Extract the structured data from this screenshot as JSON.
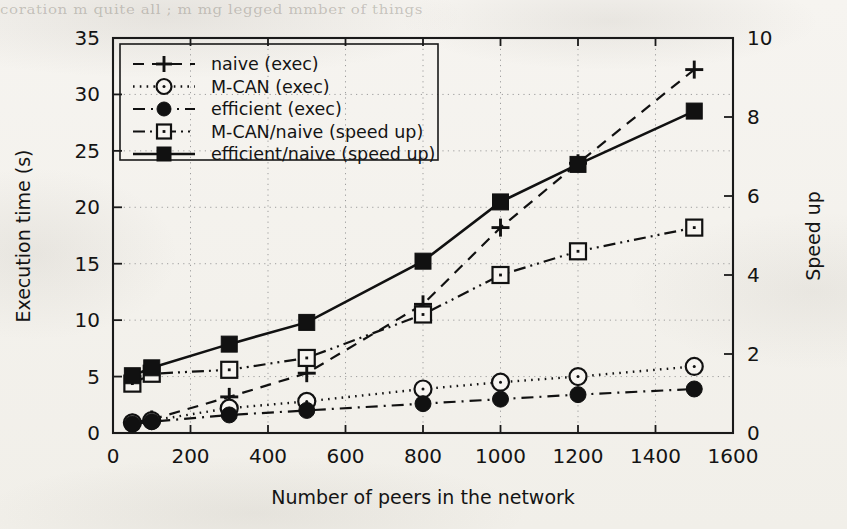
{
  "page": {
    "bleed_through_text": "coration  m  quite  all ; m  mg  legged  mmber  of  things",
    "background_color": "#f4f2ee"
  },
  "chart_data": {
    "type": "line",
    "title": "",
    "xlabel": "Number of peers in the network",
    "ylabel": "Execution time (s)",
    "y2label": "Speed up",
    "xlim": [
      0,
      1600
    ],
    "ylim": [
      0,
      35
    ],
    "y2lim": [
      0,
      10
    ],
    "xticks": [
      0,
      200,
      400,
      600,
      800,
      1000,
      1200,
      1400,
      1600
    ],
    "yticks": [
      0,
      5,
      10,
      15,
      20,
      25,
      30,
      35
    ],
    "y2ticks": [
      0,
      2,
      4,
      6,
      8,
      10
    ],
    "xtick_labels": [
      "0",
      "200",
      "400",
      "600",
      "800",
      "1000",
      "1200",
      "1400",
      "1600"
    ],
    "ytick_labels": [
      "0",
      "5",
      "10",
      "15",
      "20",
      "25",
      "30",
      "35"
    ],
    "y2tick_labels": [
      "0",
      "2",
      "4",
      "6",
      "8",
      "10"
    ],
    "grid": true,
    "legend_position": "upper left",
    "x": [
      50,
      100,
      300,
      500,
      800,
      1000,
      1200,
      1500
    ],
    "series": [
      {
        "name": "naive (exec)",
        "axis": "left",
        "marker": "plus",
        "linestyle": "dashed",
        "color": "#111111",
        "values": [
          0.9,
          1.2,
          3.2,
          5.3,
          11.4,
          18.2,
          23.9,
          32.2
        ]
      },
      {
        "name": "M-CAN (exec)",
        "axis": "left",
        "marker": "circle-open",
        "linestyle": "dotted",
        "color": "#111111",
        "values": [
          0.9,
          1.1,
          2.2,
          2.8,
          3.9,
          4.5,
          5.0,
          5.9
        ]
      },
      {
        "name": "efficient (exec)",
        "axis": "left",
        "marker": "circle-filled",
        "linestyle": "dashdot",
        "color": "#111111",
        "values": [
          0.8,
          1.0,
          1.6,
          2.0,
          2.6,
          3.0,
          3.4,
          3.9
        ]
      },
      {
        "name": "M-CAN/naive (speed up)",
        "axis": "right",
        "marker": "square-open",
        "linestyle": "dashdotdot",
        "color": "#111111",
        "values": [
          1.25,
          1.5,
          1.6,
          1.9,
          3.0,
          4.0,
          4.6,
          5.2
        ]
      },
      {
        "name": "efficient/naive (speed up)",
        "axis": "right",
        "marker": "square-filled",
        "linestyle": "solid",
        "color": "#111111",
        "values": [
          1.45,
          1.65,
          2.25,
          2.8,
          4.35,
          5.85,
          6.8,
          8.15
        ]
      }
    ]
  }
}
